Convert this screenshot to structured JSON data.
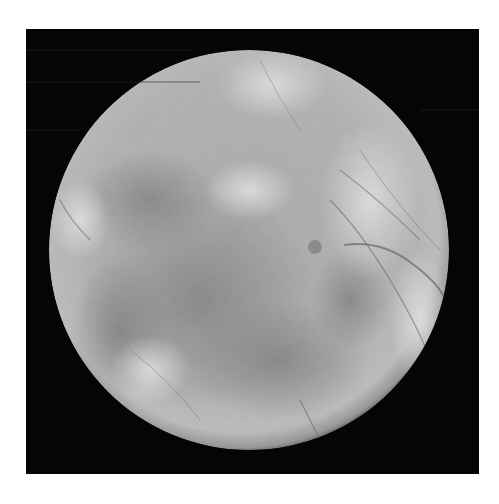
{
  "image": {
    "subject": "Moon photograph (icy satellite, grayscale)",
    "alt": "Grayscale photograph of an icy moon with dark lineae and mottled terrain on a black background",
    "colors": {
      "page_background": "#ffffff",
      "space_background": "#050505",
      "surface_light": "#e6e6e6",
      "surface_mid": "#a9a9a9",
      "surface_dark": "#7c7c7c",
      "lineae": "#6a6a6a"
    }
  }
}
